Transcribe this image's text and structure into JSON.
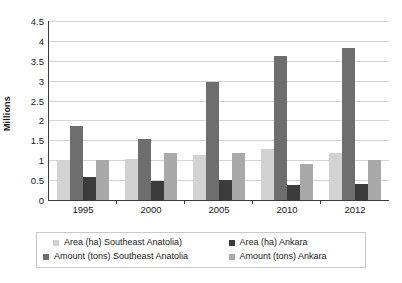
{
  "chart_data": {
    "type": "bar",
    "title": "",
    "subtitle": "",
    "xlabel": "",
    "ylabel": "Millions",
    "ylim": [
      0,
      4.5
    ],
    "ytick_step": 0.5,
    "grid": true,
    "grid_axis": "y",
    "legend_position": "bottom",
    "legend_columns": 2,
    "bar_mode": "grouped",
    "categories": [
      "1995",
      "2000",
      "2005",
      "2010",
      "2012"
    ],
    "ytick_labels": [
      "0",
      "0.5",
      "1",
      "1.5",
      "2",
      "2.5",
      "3",
      "3.5",
      "4",
      "4.5"
    ],
    "ytick_values": [
      0,
      0.5,
      1,
      1.5,
      2,
      2.5,
      3,
      3.5,
      4,
      4.5
    ],
    "series": [
      {
        "name": "Area (ha) Southeast Anatolia)",
        "color": "#d2d2d2",
        "values": [
          1.0,
          1.02,
          1.13,
          1.28,
          1.17
        ]
      },
      {
        "name": "Area (ha) Ankara",
        "color": "#3c3c3c",
        "values": [
          0.58,
          0.47,
          0.5,
          0.39,
          0.4
        ]
      },
      {
        "name": "Amount (tons) Southeast Anatolia",
        "color": "#6e6e6e",
        "values": [
          1.87,
          1.53,
          2.97,
          3.62,
          3.83
        ]
      },
      {
        "name": "Amount (tons) Ankara",
        "color": "#a9a9a9",
        "values": [
          1.0,
          1.19,
          1.19,
          0.9,
          1.0
        ]
      }
    ],
    "plot_order": [
      "Area (ha) Southeast Anatolia)",
      "Amount (tons) Southeast Anatolia",
      "Area (ha) Ankara",
      "Amount (tons) Ankara"
    ],
    "colors": {
      "axis": "#3a3a3a",
      "gridline": "#d4d4d4",
      "text": "#1a1a1a",
      "background": "#ffffff",
      "legend_border": "#c8c8c8"
    }
  }
}
